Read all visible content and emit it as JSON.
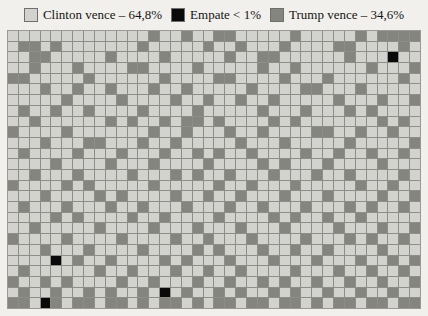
{
  "legend": {
    "items": [
      {
        "label": "Clinton vence – 64,8%",
        "color": "#d2d2ce",
        "key": "clinton",
        "swatch_name": "legend-swatch-clinton"
      },
      {
        "label": "Empate < 1%",
        "color": "#0a0a0a",
        "key": "tie",
        "swatch_name": "legend-swatch-empate"
      },
      {
        "label": "Trump vence – 34,6%",
        "color": "#858580",
        "key": "trump",
        "swatch_name": "legend-swatch-trump"
      }
    ]
  },
  "chart_data": {
    "type": "heatmap",
    "subtype": "waffle-grid-simulation",
    "title": "",
    "xlabel": "",
    "ylabel": "",
    "grid": {
      "columns": 38,
      "rows": 26,
      "total_cells": 988
    },
    "legend_position": "top-center",
    "gridlines": true,
    "categories": [
      "Clinton vence",
      "Empate",
      "Trump vence"
    ],
    "values": [
      64.8,
      0.6,
      34.6
    ],
    "value_labels": [
      "64,8%",
      "< 1%",
      "34,6%"
    ],
    "colors": {
      "clinton": "#d2d2ce",
      "tie": "#0a0a0a",
      "trump": "#858580"
    },
    "counts": {
      "clinton": 640,
      "tie": 6,
      "trump": 342
    },
    "cells": [
      "c",
      "c",
      "c",
      "c",
      "c",
      "c",
      "c",
      "c",
      "c",
      "c",
      "c",
      "c",
      "c",
      "t",
      "c",
      "c",
      "t",
      "c",
      "c",
      "t",
      "t",
      "c",
      "c",
      "c",
      "c",
      "c",
      "t",
      "c",
      "c",
      "c",
      "c",
      "c",
      "t",
      "c",
      "t",
      "t",
      "t",
      "t",
      "c",
      "t",
      "t",
      "c",
      "t",
      "c",
      "c",
      "c",
      "c",
      "c",
      "c",
      "c",
      "t",
      "c",
      "c",
      "c",
      "c",
      "c",
      "t",
      "c",
      "c",
      "t",
      "c",
      "c",
      "c",
      "t",
      "c",
      "c",
      "c",
      "c",
      "t",
      "t",
      "c",
      "c",
      "c",
      "c",
      "t",
      "c",
      "c",
      "c",
      "t",
      "t",
      "c",
      "c",
      "c",
      "c",
      "c",
      "t",
      "c",
      "c",
      "c",
      "c",
      "t",
      "c",
      "c",
      "c",
      "c",
      "c",
      "t",
      "c",
      "c",
      "t",
      "t",
      "c",
      "c",
      "c",
      "c",
      "c",
      "c",
      "t",
      "c",
      "c",
      "c",
      "e",
      "c",
      "c",
      "c",
      "c",
      "t",
      "c",
      "c",
      "c",
      "t",
      "c",
      "c",
      "c",
      "c",
      "t",
      "t",
      "c",
      "c",
      "c",
      "c",
      "t",
      "c",
      "c",
      "c",
      "c",
      "c",
      "t",
      "c",
      "c",
      "t",
      "c",
      "c",
      "c",
      "c",
      "c",
      "c",
      "t",
      "c",
      "c",
      "c",
      "t",
      "t",
      "t",
      "c",
      "c",
      "c",
      "c",
      "c",
      "t",
      "c",
      "c",
      "c",
      "c",
      "c",
      "c",
      "t",
      "c",
      "c",
      "c",
      "c",
      "t",
      "t",
      "c",
      "c",
      "c",
      "c",
      "t",
      "c",
      "c",
      "c",
      "t",
      "c",
      "c",
      "c",
      "c",
      "c",
      "c",
      "t",
      "c",
      "c",
      "c",
      "c",
      "t",
      "c",
      "c",
      "t",
      "c",
      "c",
      "t",
      "c",
      "c",
      "c",
      "t",
      "c",
      "c",
      "t",
      "c",
      "c",
      "c",
      "c",
      "c",
      "t",
      "c",
      "c",
      "c",
      "c",
      "t",
      "t",
      "c",
      "c",
      "c",
      "t",
      "c",
      "c",
      "c",
      "c",
      "c",
      "c",
      "c",
      "c",
      "c",
      "c",
      "t",
      "c",
      "c",
      "c",
      "c",
      "t",
      "c",
      "c",
      "c",
      "c",
      "t",
      "c",
      "c",
      "t",
      "c",
      "c",
      "t",
      "c",
      "c",
      "t",
      "c",
      "c",
      "c",
      "c",
      "c",
      "t",
      "c",
      "c",
      "c",
      "t",
      "c",
      "c",
      "t",
      "c",
      "t",
      "c",
      "c",
      "t",
      "c",
      "c",
      "t",
      "c",
      "c",
      "c",
      "c",
      "t",
      "c",
      "c",
      "c",
      "c",
      "t",
      "c",
      "c",
      "c",
      "c",
      "c",
      "t",
      "c",
      "c",
      "c",
      "t",
      "c",
      "c",
      "c",
      "t",
      "c",
      "t",
      "c",
      "c",
      "c",
      "c",
      "c",
      "c",
      "t",
      "c",
      "c",
      "c",
      "c",
      "c",
      "c",
      "t",
      "c",
      "t",
      "c",
      "c",
      "t",
      "c",
      "t",
      "t",
      "c",
      "t",
      "c",
      "c",
      "c",
      "c",
      "t",
      "c",
      "t",
      "c",
      "c",
      "c",
      "c",
      "c",
      "c",
      "c",
      "t",
      "c",
      "t",
      "c",
      "t",
      "c",
      "c",
      "c",
      "c",
      "t",
      "c",
      "c",
      "c",
      "c",
      "c",
      "c",
      "c",
      "t",
      "c",
      "c",
      "t",
      "c",
      "c",
      "c",
      "t",
      "c",
      "c",
      "t",
      "c",
      "c",
      "c",
      "c",
      "t",
      "t",
      "c",
      "c",
      "t",
      "c",
      "c",
      "t",
      "c",
      "c",
      "c",
      "c",
      "c",
      "t",
      "c",
      "c",
      "c",
      "t",
      "t",
      "c",
      "c",
      "c",
      "t",
      "c",
      "c",
      "t",
      "c",
      "c",
      "c",
      "c",
      "c",
      "t",
      "c",
      "c",
      "c",
      "t",
      "c",
      "c",
      "c",
      "c",
      "c",
      "t",
      "c",
      "c",
      "c",
      "c",
      "c",
      "t",
      "c",
      "t",
      "c",
      "c",
      "c",
      "c",
      "t",
      "c",
      "c",
      "c",
      "t",
      "c",
      "c",
      "c",
      "t",
      "c",
      "c",
      "t",
      "c",
      "t",
      "c",
      "c",
      "t",
      "c",
      "c",
      "c",
      "c",
      "t",
      "c",
      "c",
      "t",
      "c",
      "c",
      "t",
      "c",
      "c",
      "t",
      "c",
      "c",
      "c",
      "c",
      "c",
      "t",
      "c",
      "c",
      "c",
      "c",
      "t",
      "c",
      "c",
      "c",
      "t",
      "c",
      "c",
      "c",
      "c",
      "t",
      "c",
      "c",
      "c",
      "c",
      "t",
      "c",
      "t",
      "c",
      "c",
      "c",
      "t",
      "c",
      "c",
      "c",
      "c",
      "t",
      "c",
      "c",
      "c",
      "c",
      "c",
      "t",
      "c",
      "c",
      "c",
      "t",
      "c",
      "c",
      "c",
      "c",
      "t",
      "c",
      "c",
      "c",
      "t",
      "c",
      "t",
      "c",
      "c",
      "t",
      "c",
      "c",
      "c",
      "t",
      "c",
      "c",
      "c",
      "t",
      "c",
      "c",
      "t",
      "c",
      "c",
      "c",
      "c",
      "t",
      "c",
      "t",
      "c",
      "c",
      "c",
      "c",
      "t",
      "c",
      "t",
      "c",
      "c",
      "c",
      "c",
      "c",
      "t",
      "c",
      "c",
      "c",
      "c",
      "c",
      "t",
      "c",
      "c",
      "t",
      "c",
      "c",
      "c",
      "t",
      "c",
      "c",
      "c",
      "c",
      "c",
      "t",
      "c",
      "c",
      "t",
      "c",
      "c",
      "c",
      "c",
      "c",
      "t",
      "c",
      "c",
      "c",
      "c",
      "t",
      "c",
      "t",
      "c",
      "c",
      "c",
      "c",
      "t",
      "c",
      "c",
      "t",
      "c",
      "c",
      "t",
      "c",
      "c",
      "c",
      "t",
      "c",
      "c",
      "c",
      "t",
      "c",
      "c",
      "c",
      "c",
      "t",
      "c",
      "c",
      "t",
      "c",
      "t",
      "c",
      "c",
      "c",
      "t",
      "c",
      "c",
      "c",
      "t",
      "c",
      "c",
      "t",
      "c",
      "c",
      "c",
      "t",
      "c",
      "c",
      "c",
      "t",
      "c",
      "c",
      "t",
      "c",
      "c",
      "c",
      "t",
      "c",
      "c",
      "c",
      "t",
      "c",
      "t",
      "c",
      "c",
      "t",
      "c",
      "c",
      "c",
      "c",
      "c",
      "t",
      "c",
      "t",
      "c",
      "c",
      "c",
      "c",
      "t",
      "c",
      "c",
      "t",
      "c",
      "c",
      "c",
      "c",
      "t",
      "c",
      "c",
      "c",
      "c",
      "t",
      "c",
      "t",
      "c",
      "c",
      "t",
      "c",
      "c",
      "t",
      "c",
      "c",
      "c",
      "c",
      "c",
      "c",
      "c",
      "t",
      "c",
      "c",
      "c",
      "c",
      "c",
      "t",
      "c",
      "c",
      "c",
      "c",
      "t",
      "c",
      "c",
      "c",
      "t",
      "c",
      "c",
      "c",
      "t",
      "c",
      "c",
      "c",
      "t",
      "c",
      "c",
      "c",
      "c",
      "t",
      "c",
      "c",
      "c",
      "t",
      "c",
      "c",
      "t",
      "t",
      "c",
      "c",
      "c",
      "c",
      "t",
      "c",
      "c",
      "c",
      "c",
      "t",
      "c",
      "c",
      "c",
      "c",
      "t",
      "c",
      "c",
      "t",
      "c",
      "c",
      "c",
      "t",
      "c",
      "c",
      "c",
      "c",
      "t",
      "c",
      "c",
      "c",
      "t",
      "c",
      "t",
      "c",
      "c",
      "t",
      "c",
      "c",
      "c",
      "c",
      "t",
      "c",
      "c",
      "c",
      "t",
      "c",
      "c",
      "c",
      "c",
      "t",
      "c",
      "c",
      "c",
      "c",
      "t",
      "c",
      "t",
      "c",
      "c",
      "c",
      "t",
      "c",
      "c",
      "t",
      "c",
      "c",
      "t",
      "c",
      "c",
      "c",
      "c",
      "t",
      "c",
      "c",
      "c",
      "c",
      "c",
      "c",
      "c",
      "e",
      "c",
      "t",
      "c",
      "c",
      "t",
      "c",
      "c",
      "c",
      "c",
      "t",
      "c",
      "t",
      "c",
      "c",
      "c",
      "t",
      "c",
      "c",
      "c",
      "t",
      "c",
      "c",
      "c",
      "t",
      "c",
      "c",
      "c",
      "t",
      "c",
      "c",
      "t",
      "c",
      "t",
      "c",
      "t",
      "c",
      "c",
      "c",
      "c",
      "c",
      "c",
      "t",
      "c",
      "c",
      "t",
      "c",
      "c",
      "c",
      "t",
      "c",
      "c",
      "t",
      "c",
      "c",
      "t",
      "c",
      "c",
      "c",
      "c",
      "t",
      "c",
      "c",
      "c",
      "t",
      "c",
      "c",
      "t",
      "c",
      "c",
      "t",
      "c",
      "t",
      "c",
      "c",
      "t",
      "c",
      "t",
      "c",
      "c",
      "c",
      "c",
      "t",
      "c",
      "c",
      "t",
      "c",
      "c",
      "c",
      "t",
      "c",
      "c",
      "t",
      "c",
      "c",
      "t",
      "c",
      "t",
      "c",
      "c",
      "t",
      "c",
      "c",
      "t",
      "c",
      "c",
      "t",
      "c",
      "c",
      "t",
      "c",
      "t",
      "c",
      "c",
      "t",
      "c",
      "c",
      "t",
      "c",
      "t",
      "c",
      "c",
      "t",
      "c",
      "e",
      "c",
      "t",
      "c",
      "c",
      "t",
      "c",
      "t",
      "c",
      "c",
      "t",
      "c",
      "t",
      "c",
      "c",
      "t",
      "c",
      "c",
      "t",
      "c",
      "c",
      "t",
      "c",
      "c",
      "t",
      "t",
      "c",
      "e",
      "t",
      "c",
      "t",
      "t",
      "c",
      "t",
      "t",
      "c",
      "t",
      "c",
      "t",
      "t",
      "c",
      "t",
      "c",
      "t",
      "t",
      "c",
      "t",
      "t",
      "c",
      "t",
      "t",
      "c",
      "t",
      "c",
      "t",
      "t",
      "c",
      "t",
      "t",
      "c",
      "t",
      "t"
    ]
  }
}
